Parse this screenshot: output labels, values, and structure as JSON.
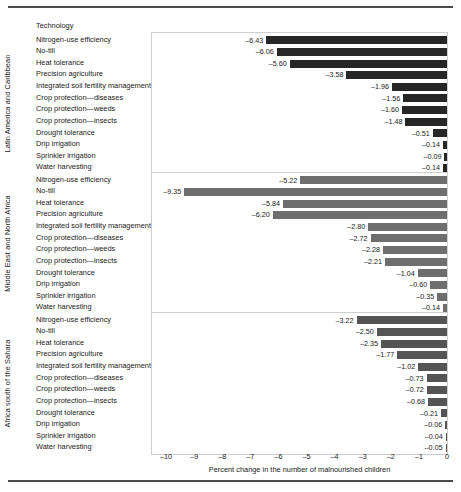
{
  "chart_data": {
    "type": "bar",
    "orientation": "horizontal",
    "title": "",
    "xlabel": "Percent change in the number of malnourished children",
    "ylabel": "",
    "column_header": "Technology",
    "xlim": [
      -10.5,
      0
    ],
    "xticks": [
      -10,
      -9,
      -8,
      -7,
      -6,
      -5,
      -4,
      -3,
      -2,
      -1,
      0
    ],
    "xticklabels": [
      "–10",
      "–9",
      "–8",
      "–7",
      "–6",
      "–5",
      "–4",
      "–3",
      "–2",
      "–1",
      "0"
    ],
    "grid": false,
    "legend": "none",
    "categories": [
      "Nitrogen-use efficiency",
      "No-till",
      "Heat tolerance",
      "Precision agriculture",
      "Integrated soil fertility management",
      "Crop protection—diseases",
      "Crop protection—weeds",
      "Crop protection—insects",
      "Drought tolerance",
      "Drip irrigation",
      "Sprinkler irrigation",
      "Water harvesting"
    ],
    "panels": [
      {
        "region": "Latin America and Caribbean",
        "color": "#262626",
        "values": [
          -6.43,
          -6.06,
          -5.6,
          -3.58,
          -1.96,
          -1.56,
          -1.6,
          -1.48,
          -0.51,
          -0.14,
          -0.09,
          -0.14
        ],
        "value_labels": [
          "–6.43",
          "–6.06",
          "–5.60",
          "–3.58",
          "–1.96",
          "–1.56",
          "–1.60",
          "–1.48",
          "–0.51",
          "–0.14",
          "–0.09",
          "–0.14"
        ]
      },
      {
        "region": "Middle East and North Africa",
        "color": "#6e6e6e",
        "values": [
          -5.22,
          -9.35,
          -5.84,
          -6.2,
          -2.8,
          -2.72,
          -2.28,
          -2.21,
          -1.04,
          -0.6,
          -0.35,
          -0.14
        ],
        "value_labels": [
          "–5.22",
          "–9.35",
          "–5.84",
          "–6.20",
          "–2.80",
          "–2.72",
          "–2.28",
          "–2.21",
          "–1.04",
          "–0.60",
          "–0.35",
          "–0.14"
        ]
      },
      {
        "region": "Africa south of the Sahara",
        "color": "#555555",
        "values": [
          -3.22,
          -2.5,
          -2.35,
          -1.77,
          -1.02,
          -0.73,
          -0.72,
          -0.68,
          -0.21,
          -0.06,
          -0.04,
          -0.05
        ],
        "value_labels": [
          "–3.22",
          "–2.50",
          "–2.35",
          "–1.77",
          "–1.02",
          "–0.73",
          "–0.72",
          "–0.68",
          "–0.21",
          "–0.06",
          "–0.04",
          "–0.05"
        ]
      }
    ]
  }
}
